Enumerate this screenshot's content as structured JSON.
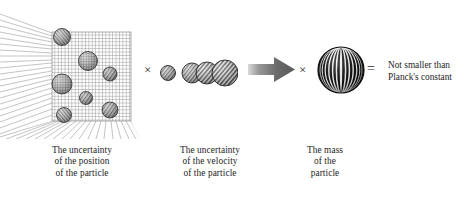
{
  "figure": {
    "operators": {
      "times_1": "×",
      "times_2": "×",
      "equals": "="
    },
    "captions": {
      "position": {
        "line1": "The uncertainty",
        "line2": "of the position",
        "line3": "of the particle"
      },
      "velocity": {
        "line1": "The uncertainty",
        "line2": "of the velocity",
        "line3": "of the particle"
      },
      "mass": {
        "line1": "The mass",
        "line2": "of the",
        "line3": "particle"
      },
      "result": {
        "line1": "Not smaller than",
        "line2": "Planck's constant"
      }
    },
    "icons": {
      "box": "perspective-grid-box-icon",
      "velocity_spheres": "sphere-cluster-icon",
      "arrow": "right-block-arrow-icon",
      "mass_sphere": "striped-sphere-icon"
    },
    "colors": {
      "text": "#1d1d1d",
      "grid": "#8a8a8a",
      "arrow": "#6f6f6f",
      "sphere_dark": "#1a1a1a",
      "sphere_light": "#d8d8d8",
      "background": "#ffffff"
    },
    "box_spheres": [
      {
        "cx": 62,
        "cy": 33,
        "r": 8.5
      },
      {
        "cx": 88,
        "cy": 57,
        "r": 9.5
      },
      {
        "cx": 110,
        "cy": 70,
        "r": 7.0
      },
      {
        "cx": 62,
        "cy": 80,
        "r": 10.0
      },
      {
        "cx": 86,
        "cy": 94,
        "r": 6.5
      },
      {
        "cx": 64,
        "cy": 111,
        "r": 7.5
      },
      {
        "cx": 110,
        "cy": 106,
        "r": 8.0
      }
    ],
    "velocity_spheres": [
      {
        "cx": 10,
        "cy": 20,
        "r": 7.5
      },
      {
        "cx": 34,
        "cy": 20,
        "r": 10.0
      },
      {
        "cx": 49,
        "cy": 20,
        "r": 11.0
      },
      {
        "cx": 67,
        "cy": 20,
        "r": 13.0
      }
    ],
    "mass_sphere": {
      "cx": 24,
      "cy": 25,
      "r": 23
    }
  }
}
